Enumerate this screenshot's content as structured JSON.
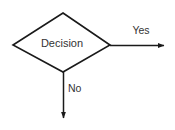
{
  "canvas": {
    "width": 175,
    "height": 130,
    "background_color": "#ffffff"
  },
  "diagram": {
    "type": "flowchart",
    "stroke_color": "#1a1a1a",
    "text_color": "#333333",
    "nodes": [
      {
        "id": "decision",
        "shape": "diamond",
        "label": "Decision",
        "fill": "#ffffff",
        "stroke": "#1a1a1a",
        "points": {
          "top": [
            63,
            13
          ],
          "right": [
            110,
            45
          ],
          "bottom": [
            63,
            72
          ],
          "left": [
            13,
            45
          ]
        }
      }
    ],
    "connectors": [
      {
        "id": "yes-branch",
        "label": "Yes",
        "direction": "right",
        "from": [
          110,
          45
        ],
        "to": [
          170,
          45
        ],
        "arrowhead": "filled-triangle"
      },
      {
        "id": "no-branch",
        "label": "No",
        "direction": "down",
        "from": [
          63,
          72
        ],
        "to": [
          63,
          124
        ],
        "arrowhead": "filled-triangle"
      }
    ]
  }
}
